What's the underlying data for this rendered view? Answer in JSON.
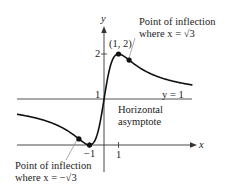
{
  "figure": {
    "function": "f(x) = 1 + 2x / (1 + x^2)",
    "axes": {
      "x_label": "x",
      "y_label": "y",
      "x_ticks": [
        {
          "value": -1,
          "label": "−1"
        },
        {
          "value": 1,
          "label": "1"
        }
      ],
      "y_ticks": [
        {
          "value": 1,
          "label": "1"
        },
        {
          "value": 2,
          "label": "2"
        }
      ]
    },
    "asymptote": {
      "label": "y = 1",
      "caption_line1": "Horizontal",
      "caption_line2": "asymptote"
    },
    "points": {
      "max_label": "(1, 2)",
      "inflection_pos_line1": "Point of inflection",
      "inflection_pos_line2": "where x = √3",
      "inflection_neg_line1": "Point of inflection",
      "inflection_neg_line2": "where x = −√3"
    },
    "colors": {
      "curve": "#111111",
      "axis": "#333333",
      "asymptote": "#555555",
      "leader": "#777777"
    }
  },
  "chart_data": {
    "type": "line",
    "title": "",
    "xlabel": "x",
    "ylabel": "y",
    "xlim": [
      -6,
      6.1
    ],
    "ylim": [
      -0.6,
      2.6
    ],
    "grid": false,
    "series": [
      {
        "name": "f(x) = 1 + 2x/(1+x²)",
        "x": [
          -6,
          -5,
          -4,
          -3,
          -1.732,
          -1,
          0,
          1,
          1.732,
          3,
          4,
          5,
          6
        ],
        "y": [
          0.676,
          0.615,
          0.529,
          0.4,
          0.134,
          0,
          1,
          2,
          1.866,
          1.6,
          1.471,
          1.385,
          1.324
        ]
      }
    ],
    "marked_points": [
      {
        "x": -1.732,
        "y": 0.134,
        "label": "Point of inflection where x = −√3"
      },
      {
        "x": -1,
        "y": 0,
        "label": "(-1, 0) minimum"
      },
      {
        "x": 1,
        "y": 2,
        "label": "(1, 2)"
      },
      {
        "x": 1.732,
        "y": 1.866,
        "label": "Point of inflection where x = √3"
      }
    ],
    "annotations": [
      "y = 1",
      "Horizontal asymptote"
    ]
  }
}
